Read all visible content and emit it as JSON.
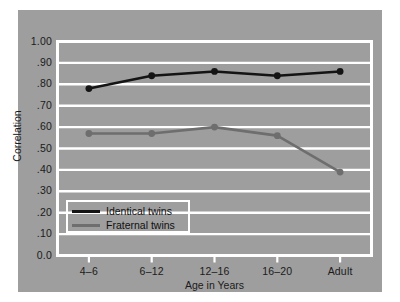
{
  "chart_data": {
    "type": "line",
    "title": "",
    "subtitle": "",
    "xlabel": "Age in Years",
    "ylabel": "Correlation",
    "categories": [
      "4–6",
      "6–12",
      "12–16",
      "16–20",
      "Adult"
    ],
    "ylim": [
      0.0,
      1.0
    ],
    "ytick_labels": [
      "1.00",
      ".90",
      ".80",
      ".70",
      ".60",
      ".50",
      ".40",
      ".30",
      ".20",
      ".10",
      "0.0"
    ],
    "ytick_values": [
      1.0,
      0.9,
      0.8,
      0.7,
      0.6,
      0.5,
      0.4,
      0.3,
      0.2,
      0.1,
      0.0
    ],
    "grid": true,
    "grid_color": "#ffffff",
    "legend_position": "inside-lower-left",
    "panel_color": "#9e9e9e",
    "series": [
      {
        "name": "Identical twins",
        "color": "#141414",
        "marker": "circle",
        "values": [
          0.78,
          0.84,
          0.86,
          0.84,
          0.86
        ]
      },
      {
        "name": "Fraternal twins",
        "color": "#6e6e6e",
        "marker": "circle",
        "values": [
          0.57,
          0.57,
          0.6,
          0.56,
          0.39
        ]
      }
    ]
  },
  "legend": {
    "items": [
      {
        "label": "Identical twins"
      },
      {
        "label": "Fraternal twins"
      }
    ]
  }
}
